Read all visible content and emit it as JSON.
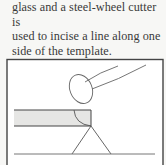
{
  "caption": {
    "line1": "glass and a steel-wheel cutter is",
    "line2": "used to incise a line along one",
    "line3": "side of the template."
  },
  "figure": {
    "colors": {
      "stroke": "#555555",
      "frame": "#444444",
      "glass_fill": "#e6e6e4",
      "background": "#ffffff"
    }
  }
}
